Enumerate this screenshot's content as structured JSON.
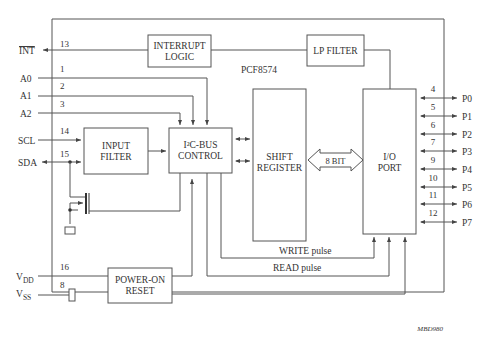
{
  "chip": {
    "name": "PCF8574",
    "figure_id": "MBD980"
  },
  "blocks": {
    "interrupt_logic": [
      "INTERRUPT",
      "LOGIC"
    ],
    "lp_filter": "LP FILTER",
    "input_filter": [
      "INPUT",
      "FILTER"
    ],
    "i2c_control": [
      "I²C-BUS",
      "CONTROL"
    ],
    "shift_register": [
      "SHIFT",
      "REGISTER"
    ],
    "io_port": [
      "I/O",
      "PORT"
    ],
    "power_on_reset": [
      "POWER-ON",
      "RESET"
    ],
    "bus_width": "8 BIT"
  },
  "left_pins": [
    {
      "name": "INT",
      "number": "13"
    },
    {
      "name": "A0",
      "number": "1"
    },
    {
      "name": "A1",
      "number": "2"
    },
    {
      "name": "A2",
      "number": "3"
    },
    {
      "name": "SCL",
      "number": "14"
    },
    {
      "name": "SDA",
      "number": "15"
    },
    {
      "name": "V",
      "sub": "DD",
      "number": "16"
    },
    {
      "name": "V",
      "sub": "SS",
      "number": "8"
    }
  ],
  "right_pins": [
    {
      "name": "P0",
      "number": "4"
    },
    {
      "name": "P1",
      "number": "5"
    },
    {
      "name": "P2",
      "number": "6"
    },
    {
      "name": "P3",
      "number": "7"
    },
    {
      "name": "P4",
      "number": "9"
    },
    {
      "name": "P5",
      "number": "10"
    },
    {
      "name": "P6",
      "number": "11"
    },
    {
      "name": "P7",
      "number": "12"
    }
  ],
  "signals": {
    "write": "WRITE pulse",
    "read": "READ pulse"
  }
}
